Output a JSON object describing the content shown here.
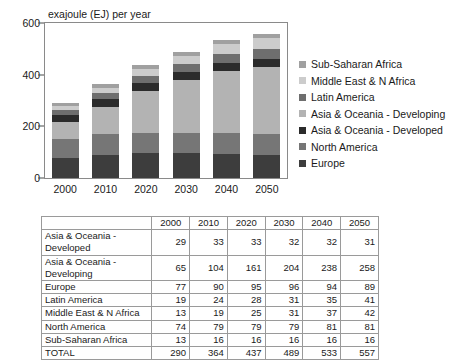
{
  "chart_data": {
    "type": "bar",
    "stacked": true,
    "title": "exajoule (EJ) per year",
    "xlabel": "",
    "ylabel": "exajoule (EJ) per year",
    "ylim": [
      0,
      600
    ],
    "yticks": [
      0,
      200,
      400,
      600
    ],
    "grid": false,
    "legend_position": "right",
    "categories": [
      "2000",
      "2010",
      "2020",
      "2030",
      "2040",
      "2050"
    ],
    "stack_order_bottom_to_top": [
      "Europe",
      "North America",
      "Asia & Oceania - Developing",
      "Asia & Oceania - Developed",
      "Latin America",
      "Middle East & N Africa",
      "Sub-Saharan Africa"
    ],
    "series": [
      {
        "name": "Europe",
        "values": [
          77,
          90,
          95,
          96,
          94,
          89
        ],
        "color": "#3d3d3d"
      },
      {
        "name": "North America",
        "values": [
          74,
          79,
          79,
          79,
          81,
          81
        ],
        "color": "#767676"
      },
      {
        "name": "Asia & Oceania - Developing",
        "values": [
          65,
          104,
          161,
          204,
          238,
          258
        ],
        "color": "#b3b3b3"
      },
      {
        "name": "Asia & Oceania - Developed",
        "values": [
          29,
          33,
          33,
          32,
          32,
          31
        ],
        "color": "#2b2b2b"
      },
      {
        "name": "Latin America",
        "values": [
          19,
          24,
          28,
          31,
          35,
          41
        ],
        "color": "#6e6e6e"
      },
      {
        "name": "Middle East & N Africa",
        "values": [
          13,
          19,
          25,
          31,
          37,
          42
        ],
        "color": "#cccccc"
      },
      {
        "name": "Sub-Saharan Africa",
        "values": [
          13,
          16,
          16,
          16,
          16,
          16
        ],
        "color": "#a0a0a0"
      }
    ],
    "totals": [
      290,
      364,
      437,
      489,
      533,
      557
    ]
  },
  "legend": {
    "items": [
      {
        "label": "Sub-Saharan Africa",
        "color": "#a0a0a0"
      },
      {
        "label": "Middle East & N Africa",
        "color": "#cccccc"
      },
      {
        "label": "Latin America",
        "color": "#6e6e6e"
      },
      {
        "label": "Asia & Oceania - Developing",
        "color": "#b3b3b3"
      },
      {
        "label": "Asia & Oceania - Developed",
        "color": "#2b2b2b"
      },
      {
        "label": "North America",
        "color": "#767676"
      },
      {
        "label": "Europe",
        "color": "#3d3d3d"
      }
    ]
  },
  "axes": {
    "ytick_labels": [
      "600",
      "400",
      "200",
      "0"
    ],
    "xtick_labels": [
      "2000",
      "2010",
      "2020",
      "2030",
      "2040",
      "2050"
    ]
  },
  "table": {
    "corner_label": "",
    "headers": [
      "2000",
      "2010",
      "2020",
      "2030",
      "2040",
      "2050"
    ],
    "rows": [
      {
        "label": "Asia & Oceania - Developed",
        "values": [
          "29",
          "33",
          "33",
          "32",
          "32",
          "31"
        ]
      },
      {
        "label": "Asia & Oceania - Developing",
        "values": [
          "65",
          "104",
          "161",
          "204",
          "238",
          "258"
        ]
      },
      {
        "label": "Europe",
        "values": [
          "77",
          "90",
          "95",
          "96",
          "94",
          "89"
        ]
      },
      {
        "label": "Latin America",
        "values": [
          "19",
          "24",
          "28",
          "31",
          "35",
          "41"
        ]
      },
      {
        "label": "Middle East & N Africa",
        "values": [
          "13",
          "19",
          "25",
          "31",
          "37",
          "42"
        ]
      },
      {
        "label": "North America",
        "values": [
          "74",
          "79",
          "79",
          "79",
          "81",
          "81"
        ]
      },
      {
        "label": "Sub-Saharan Africa",
        "values": [
          "13",
          "16",
          "16",
          "16",
          "16",
          "16"
        ]
      }
    ],
    "total_row": {
      "label": "TOTAL",
      "values": [
        "290",
        "364",
        "437",
        "489",
        "533",
        "557"
      ]
    }
  }
}
